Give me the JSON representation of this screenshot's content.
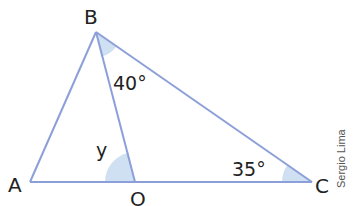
{
  "diagram": {
    "type": "geometry-triangle",
    "points": {
      "A": {
        "label": "A",
        "x": 30,
        "y": 182
      },
      "B": {
        "label": "B",
        "x": 96,
        "y": 32
      },
      "O": {
        "label": "O",
        "x": 135,
        "y": 182
      },
      "C": {
        "label": "C",
        "x": 312,
        "y": 182
      }
    },
    "segments": [
      "AB",
      "BO",
      "BC",
      "AC"
    ],
    "angles": {
      "OBC": {
        "label": "40°",
        "vertex": "B"
      },
      "BOA": {
        "label": "y",
        "vertex": "O"
      },
      "BCO": {
        "label": "35°",
        "vertex": "C"
      }
    },
    "colors": {
      "line": "#8c9fd8",
      "angle_fill": "#cfe0f3"
    }
  },
  "labels": {
    "A": "A",
    "B": "B",
    "O": "O",
    "C": "C",
    "angle_B": "40°",
    "angle_O": "y",
    "angle_C": "35°"
  },
  "credit": "Sergio Lima"
}
